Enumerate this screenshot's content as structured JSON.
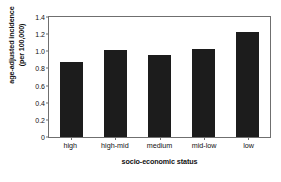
{
  "chart_data": {
    "type": "bar",
    "title": "",
    "categories": [
      "high",
      "high-mid",
      "medium",
      "mid-low",
      "low"
    ],
    "values": [
      0.88,
      1.02,
      0.96,
      1.03,
      1.23
    ],
    "xlabel": "socio-economic status",
    "ylabel": "age-adjusted incidence (per 100,000)",
    "ylabel_line1": "age-adjusted incidence",
    "ylabel_line2": "(per 100,000)",
    "ylim": [
      0,
      1.4
    ],
    "yticks": [
      "0",
      "0.2",
      "0.4",
      "0.6",
      "0.8",
      "1.0",
      "1.2",
      "1.4"
    ],
    "ytick_values": [
      0,
      0.2,
      0.4,
      0.6,
      0.8,
      1.0,
      1.2,
      1.4
    ],
    "grid": false,
    "legend": "none",
    "bar_color": "#1c1c1c",
    "frame_color": "#6f6f6f",
    "background": "#ffffff"
  }
}
